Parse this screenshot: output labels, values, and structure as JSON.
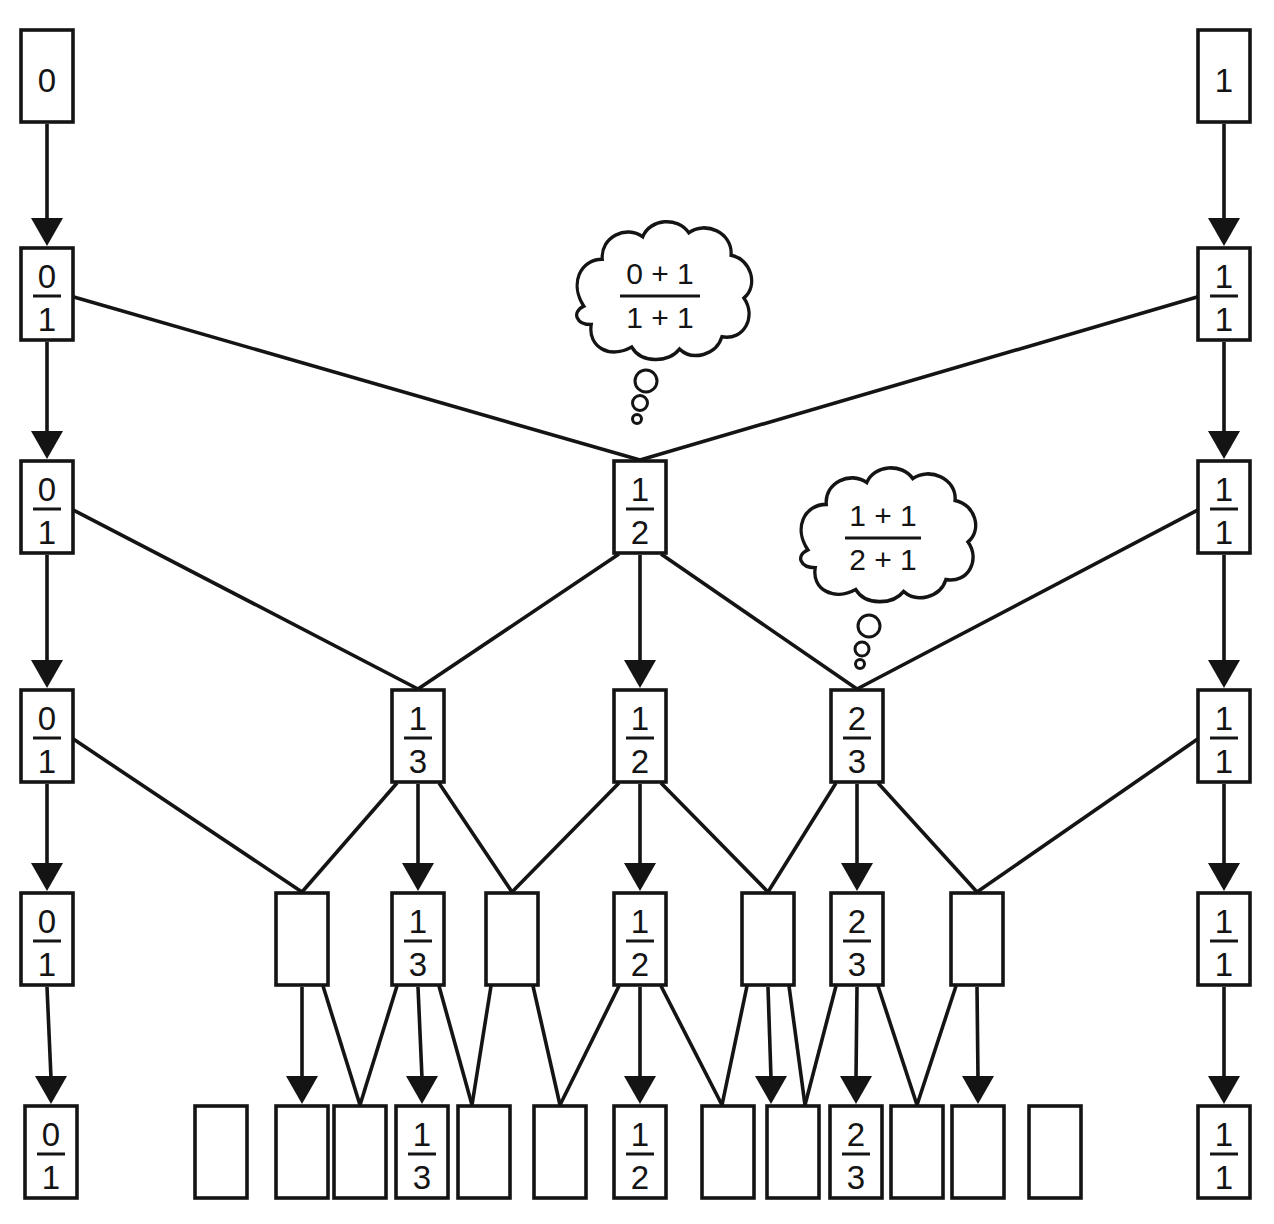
{
  "diagram": {
    "background": "#ffffff",
    "line_color": "#141414",
    "box_width": 52,
    "box_height": 92,
    "stroke_width": 3.6,
    "box_font_size": 33,
    "bubble_font_size": 30,
    "nodes": [
      {
        "id": "r1-zero",
        "x": 21,
        "y": 30,
        "value": "0"
      },
      {
        "id": "r1-one",
        "x": 1198,
        "y": 30,
        "value": "1"
      },
      {
        "id": "r2-01",
        "x": 21,
        "y": 248,
        "num": "0",
        "den": "1"
      },
      {
        "id": "r2-11",
        "x": 1198,
        "y": 248,
        "num": "1",
        "den": "1"
      },
      {
        "id": "r3-01",
        "x": 21,
        "y": 461,
        "num": "0",
        "den": "1"
      },
      {
        "id": "r3-12",
        "x": 614,
        "y": 461,
        "num": "1",
        "den": "2"
      },
      {
        "id": "r3-11",
        "x": 1198,
        "y": 461,
        "num": "1",
        "den": "1"
      },
      {
        "id": "r4-01",
        "x": 21,
        "y": 690,
        "num": "0",
        "den": "1"
      },
      {
        "id": "r4-13",
        "x": 392,
        "y": 690,
        "num": "1",
        "den": "3"
      },
      {
        "id": "r4-12",
        "x": 614,
        "y": 690,
        "num": "1",
        "den": "2"
      },
      {
        "id": "r4-23",
        "x": 831,
        "y": 690,
        "num": "2",
        "den": "3"
      },
      {
        "id": "r4-11",
        "x": 1198,
        "y": 690,
        "num": "1",
        "den": "1"
      },
      {
        "id": "r5-01",
        "x": 21,
        "y": 893,
        "num": "0",
        "den": "1"
      },
      {
        "id": "r5-e1",
        "x": 276,
        "y": 893
      },
      {
        "id": "r5-13",
        "x": 392,
        "y": 893,
        "num": "1",
        "den": "3"
      },
      {
        "id": "r5-e2",
        "x": 486,
        "y": 893
      },
      {
        "id": "r5-12",
        "x": 614,
        "y": 893,
        "num": "1",
        "den": "2"
      },
      {
        "id": "r5-e3",
        "x": 742,
        "y": 893
      },
      {
        "id": "r5-23",
        "x": 831,
        "y": 893,
        "num": "2",
        "den": "3"
      },
      {
        "id": "r5-e4",
        "x": 951,
        "y": 893
      },
      {
        "id": "r5-11",
        "x": 1198,
        "y": 893,
        "num": "1",
        "den": "1"
      },
      {
        "id": "r6-01",
        "x": 25,
        "y": 1106,
        "num": "0",
        "den": "1"
      },
      {
        "id": "r6-b2",
        "x": 195,
        "y": 1106
      },
      {
        "id": "r6-b3",
        "x": 276,
        "y": 1106
      },
      {
        "id": "r6-b4",
        "x": 334,
        "y": 1106
      },
      {
        "id": "r6-13",
        "x": 396,
        "y": 1106,
        "num": "1",
        "den": "3"
      },
      {
        "id": "r6-b6",
        "x": 458,
        "y": 1106
      },
      {
        "id": "r6-b7",
        "x": 534,
        "y": 1106
      },
      {
        "id": "r6-12",
        "x": 614,
        "y": 1106,
        "num": "1",
        "den": "2"
      },
      {
        "id": "r6-b9",
        "x": 702,
        "y": 1106
      },
      {
        "id": "r6-b10",
        "x": 767,
        "y": 1106
      },
      {
        "id": "r6-23",
        "x": 830,
        "y": 1106,
        "num": "2",
        "den": "3"
      },
      {
        "id": "r6-b12",
        "x": 891,
        "y": 1106
      },
      {
        "id": "r6-b13",
        "x": 952,
        "y": 1106
      },
      {
        "id": "r6-b14",
        "x": 1029,
        "y": 1106
      },
      {
        "id": "r6-11",
        "x": 1198,
        "y": 1106,
        "num": "1",
        "den": "1"
      }
    ],
    "edges": [
      {
        "f": "r1-zero",
        "t": "r2-01",
        "k": "arrow"
      },
      {
        "f": "r1-one",
        "t": "r2-11",
        "k": "arrow"
      },
      {
        "f": "r2-01",
        "t": "r3-01",
        "k": "arrow"
      },
      {
        "f": "r2-11",
        "t": "r3-11",
        "k": "arrow"
      },
      {
        "f": "r2-01",
        "t": "r3-12",
        "k": "line",
        "fa": "r"
      },
      {
        "f": "r2-11",
        "t": "r3-12",
        "k": "line",
        "fa": "l"
      },
      {
        "f": "r3-01",
        "t": "r4-01",
        "k": "arrow"
      },
      {
        "f": "r3-12",
        "t": "r4-12",
        "k": "arrow"
      },
      {
        "f": "r3-11",
        "t": "r4-11",
        "k": "arrow"
      },
      {
        "f": "r3-01",
        "t": "r4-13",
        "k": "line",
        "fa": "r"
      },
      {
        "f": "r3-12",
        "t": "r4-13",
        "k": "line",
        "fa": "bl"
      },
      {
        "f": "r3-12",
        "t": "r4-23",
        "k": "line",
        "fa": "br"
      },
      {
        "f": "r3-11",
        "t": "r4-23",
        "k": "line",
        "fa": "l"
      },
      {
        "f": "r4-01",
        "t": "r5-01",
        "k": "arrow"
      },
      {
        "f": "r4-13",
        "t": "r5-13",
        "k": "arrow"
      },
      {
        "f": "r4-12",
        "t": "r5-12",
        "k": "arrow"
      },
      {
        "f": "r4-23",
        "t": "r5-23",
        "k": "arrow"
      },
      {
        "f": "r4-11",
        "t": "r5-11",
        "k": "arrow"
      },
      {
        "f": "r4-01",
        "t": "r5-e1",
        "k": "line",
        "fa": "r"
      },
      {
        "f": "r4-13",
        "t": "r5-e1",
        "k": "line",
        "fa": "bl"
      },
      {
        "f": "r4-13",
        "t": "r5-e2",
        "k": "line",
        "fa": "br"
      },
      {
        "f": "r4-12",
        "t": "r5-e2",
        "k": "line",
        "fa": "bl"
      },
      {
        "f": "r4-12",
        "t": "r5-e3",
        "k": "line",
        "fa": "br"
      },
      {
        "f": "r4-23",
        "t": "r5-e3",
        "k": "line",
        "fa": "bl"
      },
      {
        "f": "r4-23",
        "t": "r5-e4",
        "k": "line",
        "fa": "br"
      },
      {
        "f": "r4-11",
        "t": "r5-e4",
        "k": "line",
        "fa": "l"
      },
      {
        "f": "r5-01",
        "t": "r6-01",
        "k": "arrow"
      },
      {
        "f": "r5-e1",
        "t": "r6-b3",
        "k": "arrow"
      },
      {
        "f": "r5-13",
        "t": "r6-13",
        "k": "arrow"
      },
      {
        "f": "r5-12",
        "t": "r6-12",
        "k": "arrow"
      },
      {
        "f": "r5-e3",
        "t": "r6-b10",
        "k": "arrow",
        "tx": 771
      },
      {
        "f": "r5-23",
        "t": "r6-23",
        "k": "arrow"
      },
      {
        "f": "r5-e4",
        "t": "r6-b13",
        "k": "arrow"
      },
      {
        "f": "r5-11",
        "t": "r6-11",
        "k": "arrow"
      },
      {
        "f": "r5-e1",
        "t": "r6-b4",
        "k": "line",
        "fa": "br"
      },
      {
        "f": "r5-13",
        "t": "r6-b4",
        "k": "line",
        "fa": "bl"
      },
      {
        "f": "r5-13",
        "t": "r6-b6",
        "k": "line",
        "fa": "br",
        "tx": 472
      },
      {
        "f": "r5-e2",
        "t": "r6-b6",
        "k": "line",
        "fa": "bl",
        "tx": 472
      },
      {
        "f": "r5-e2",
        "t": "r6-b7",
        "k": "line",
        "fa": "br"
      },
      {
        "f": "r5-12",
        "t": "r6-b7",
        "k": "line",
        "fa": "bl"
      },
      {
        "f": "r5-12",
        "t": "r6-b9",
        "k": "line",
        "fa": "br",
        "tx": 722
      },
      {
        "f": "r5-e3",
        "t": "r6-b9",
        "k": "line",
        "fa": "bl",
        "tx": 722
      },
      {
        "f": "r5-e3",
        "t": "r6-b10",
        "k": "line",
        "fa": "br",
        "tx": 805
      },
      {
        "f": "r5-23",
        "t": "r6-b10",
        "k": "line",
        "fa": "bl",
        "tx": 805
      },
      {
        "f": "r5-23",
        "t": "r6-b12",
        "k": "line",
        "fa": "br"
      },
      {
        "f": "r5-e4",
        "t": "r6-b12",
        "k": "line",
        "fa": "bl"
      }
    ],
    "thought_bubbles": [
      {
        "num": "0 + 1",
        "den": "1 + 1",
        "cloud_cx": 663,
        "cloud_cy": 296,
        "scale_x": 0.92,
        "scale_y": 1.02,
        "text_cx": 660,
        "num_y": 284,
        "bar_y": 296,
        "den_y": 328,
        "bar_half": 40,
        "tail": [
          {
            "cx": 646,
            "cy": 381,
            "r": 11
          },
          {
            "cx": 640,
            "cy": 403,
            "r": 7.5
          },
          {
            "cx": 637,
            "cy": 419,
            "r": 4.5
          }
        ]
      },
      {
        "num": "1 + 1",
        "den": "2 + 1",
        "cloud_cx": 887,
        "cloud_cy": 540,
        "scale_x": 0.92,
        "scale_y": 0.99,
        "text_cx": 883,
        "num_y": 526,
        "bar_y": 538,
        "den_y": 570,
        "bar_half": 38,
        "tail": [
          {
            "cx": 869,
            "cy": 626,
            "r": 11
          },
          {
            "cx": 862,
            "cy": 649,
            "r": 7
          },
          {
            "cx": 860,
            "cy": 664,
            "r": 4.5
          }
        ]
      }
    ]
  }
}
